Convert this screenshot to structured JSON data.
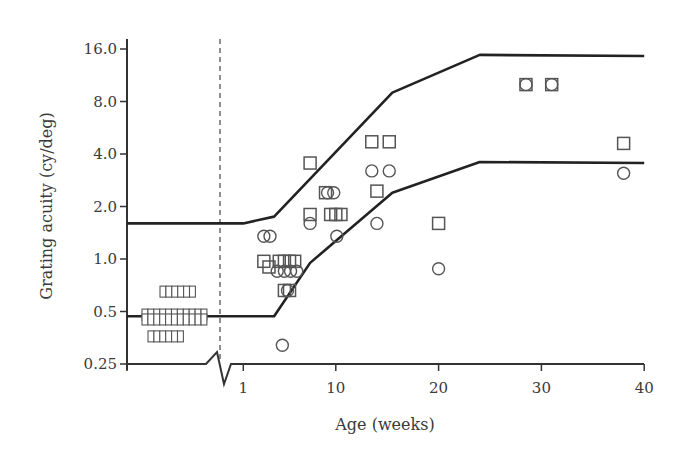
{
  "chart_data": {
    "type": "scatter",
    "title": "",
    "xlabel": "Age (weeks)",
    "ylabel": "Grating acuity (cy/deg)",
    "y_scale": "log2",
    "ylim": [
      0.25,
      16.0
    ],
    "xlim": [
      0,
      40
    ],
    "x_ticks": [
      {
        "value": 1,
        "label": "1"
      },
      {
        "value": 10,
        "label": "10"
      },
      {
        "value": 20,
        "label": "20"
      },
      {
        "value": 30,
        "label": "30"
      },
      {
        "value": 40,
        "label": "40"
      }
    ],
    "y_ticks": [
      {
        "value": 16.0,
        "label": "16.0"
      },
      {
        "value": 8.0,
        "label": "8.0"
      },
      {
        "value": 4.0,
        "label": "4.0"
      },
      {
        "value": 2.0,
        "label": "2.0"
      },
      {
        "value": 1.0,
        "label": "1.0"
      },
      {
        "value": 0.5,
        "label": "0.5"
      },
      {
        "value": 0.25,
        "label": "0.25"
      }
    ],
    "axis_break": "x-axis broken between preterm region and 1 week (dashed line marks term birth)",
    "grid": false,
    "legend": "none",
    "preterm_region": {
      "description": "Squares before term (left of dashed line)",
      "rows": [
        {
          "y": 0.65,
          "count": 6
        },
        {
          "y": 0.48,
          "count": 11
        },
        {
          "y": 0.45,
          "count": 11
        },
        {
          "y": 0.36,
          "count": 6
        }
      ]
    },
    "upper_limit_curve": {
      "name": "Upper limit",
      "preterm_y": 1.6,
      "points": [
        [
          1,
          1.6
        ],
        [
          4,
          1.75
        ],
        [
          15.5,
          9.0
        ],
        [
          24,
          14.8
        ],
        [
          40,
          14.6
        ]
      ]
    },
    "lower_limit_curve": {
      "name": "Lower limit",
      "preterm_y": 0.47,
      "points": [
        [
          1,
          0.47
        ],
        [
          4,
          0.47
        ],
        [
          7.5,
          0.95
        ],
        [
          15.5,
          2.4
        ],
        [
          24,
          3.6
        ],
        [
          40,
          3.55
        ]
      ]
    },
    "series": [
      {
        "name": "squares",
        "marker": "square",
        "points": [
          [
            3,
            0.97
          ],
          [
            3.5,
            0.9
          ],
          [
            4.5,
            0.97
          ],
          [
            5,
            0.97
          ],
          [
            5.5,
            0.97
          ],
          [
            6,
            0.97
          ],
          [
            5,
            0.66
          ],
          [
            5.5,
            0.66
          ],
          [
            7.5,
            3.55
          ],
          [
            7.5,
            1.8
          ],
          [
            9,
            2.4
          ],
          [
            9.5,
            1.8
          ],
          [
            10,
            1.8
          ],
          [
            10.5,
            1.8
          ],
          [
            13.5,
            4.7
          ],
          [
            15.2,
            4.7
          ],
          [
            14,
            2.45
          ],
          [
            20,
            1.6
          ],
          [
            28.5,
            10.0
          ],
          [
            31,
            10.0
          ],
          [
            38,
            4.6
          ]
        ]
      },
      {
        "name": "circles",
        "marker": "circle",
        "points": [
          [
            3,
            1.35
          ],
          [
            3.6,
            1.35
          ],
          [
            4.3,
            0.85
          ],
          [
            5,
            0.85
          ],
          [
            5.6,
            0.85
          ],
          [
            6.2,
            0.85
          ],
          [
            5.3,
            0.66
          ],
          [
            4.8,
            0.32
          ],
          [
            7.5,
            1.6
          ],
          [
            9.2,
            2.4
          ],
          [
            9.8,
            2.4
          ],
          [
            10.1,
            1.35
          ],
          [
            13.5,
            3.2
          ],
          [
            15.2,
            3.2
          ],
          [
            14,
            1.6
          ],
          [
            20,
            0.88
          ],
          [
            28.5,
            10.0
          ],
          [
            31,
            10.0
          ],
          [
            38,
            3.1
          ]
        ]
      }
    ]
  }
}
